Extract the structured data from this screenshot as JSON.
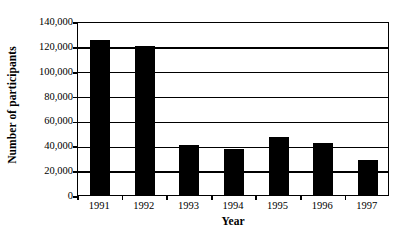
{
  "chart_data": {
    "type": "bar",
    "title": "",
    "xlabel": "Year",
    "ylabel": "Number of participants",
    "categories": [
      "1991",
      "1992",
      "1993",
      "1994",
      "1995",
      "1996",
      "1997"
    ],
    "values": [
      125000,
      120000,
      40000,
      37000,
      47000,
      42000,
      28000
    ],
    "ylim": [
      0,
      140000
    ],
    "ytick_values": [
      0,
      20000,
      40000,
      60000,
      80000,
      100000,
      120000,
      140000
    ],
    "ytick_labels": [
      "0",
      "20,000",
      "40,000",
      "60,000",
      "80,000",
      "100,000",
      "120,000",
      "140,000"
    ],
    "grid": true,
    "grid_axis": "y",
    "legend": false,
    "legend_position": "none",
    "bar_color": "#000000",
    "axis_color": "#000000",
    "background_color": "#FFFFFF",
    "bar_width_fraction": 0.45
  }
}
